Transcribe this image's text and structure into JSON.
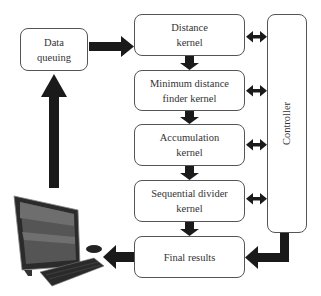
{
  "diagram": {
    "nodes": {
      "data_queuing": "Data\nqueuing",
      "distance_kernel": "Distance\nkernel",
      "min_distance": "Minimum distance\nfinder kernel",
      "accumulation": "Accumulation\nkernel",
      "sequential_divider": "Sequential divider\nkernel",
      "final_results": "Final results",
      "controller": "Controller"
    },
    "icons": {
      "computer": "all-in-one-desktop-computer"
    },
    "colors": {
      "arrow": "#1a1a1a",
      "border": "#555555",
      "text": "#333333"
    }
  }
}
